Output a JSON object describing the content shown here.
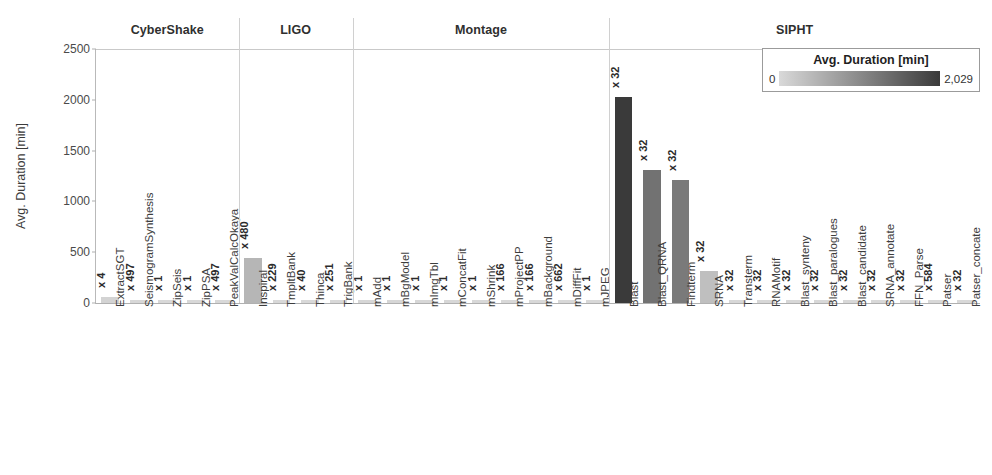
{
  "chart_data": {
    "type": "bar",
    "title": "",
    "xlabel": "",
    "ylabel": "Avg. Duration [min]",
    "ylim": [
      0,
      2500
    ],
    "yticks": [
      0,
      500,
      1000,
      1500,
      2000,
      2500
    ],
    "ytick_labels": [
      "0",
      "500",
      "1000",
      "1500",
      "2000",
      "2500"
    ],
    "grid": false,
    "legend_position": "top-right",
    "colormap": {
      "low": "#d9d9d9",
      "high": "#3a3a3a",
      "min": 0,
      "max": 2029
    },
    "groups": [
      {
        "name": "CyberShake",
        "categories": [
          "ExtractSGT",
          "SeismogramSynthesis",
          "ZipSeis",
          "ZipPSA",
          "PeakValCalcOkaya"
        ],
        "values": [
          62,
          8,
          3,
          3,
          3
        ],
        "counts": [
          "x 4",
          "x 497",
          "x 1",
          "x 1",
          "x 497"
        ]
      },
      {
        "name": "LIGO",
        "categories": [
          "Inspiral",
          "TmpltBank",
          "Thinca",
          "TrigBank"
        ],
        "values": [
          443,
          5,
          3,
          3
        ],
        "counts": [
          "x 480",
          "x 229",
          "x 40",
          "x 251"
        ]
      },
      {
        "name": "Montage",
        "categories": [
          "mAdd",
          "mBgModel",
          "mImgTbl",
          "mConcatFit",
          "mShrink",
          "mProjectPP",
          "mBackground",
          "mDiffFit",
          "mJPEG"
        ],
        "values": [
          26,
          24,
          18,
          12,
          6,
          5,
          5,
          4,
          4
        ],
        "counts": [
          "x 1",
          "x 1",
          "x 1",
          "x 1",
          "x 1",
          "x 166",
          "x 166",
          "x 662",
          "x 1"
        ]
      },
      {
        "name": "SIPHT",
        "categories": [
          "Blast",
          "Blast_QRNA",
          "Findterm",
          "SRNA",
          "Transterm",
          "RNAMotif",
          "Blast_synteny",
          "Blast_paralogues",
          "Blast_candidate",
          "SRNA_annotate",
          "FFN_Parse",
          "Patser",
          "Patser_concate"
        ],
        "values": [
          2029,
          1312,
          1206,
          315,
          14,
          12,
          10,
          6,
          6,
          6,
          6,
          6,
          6
        ],
        "counts": [
          "x 32",
          "x 32",
          "x 32",
          "x 32",
          "x 32",
          "x 32",
          "x 32",
          "x 32",
          "x 32",
          "x 32",
          "x 32",
          "x 584",
          "x 32"
        ]
      }
    ]
  },
  "legend": {
    "title": "Avg. Duration [min]",
    "min_label": "0",
    "max_label": "2,029"
  }
}
